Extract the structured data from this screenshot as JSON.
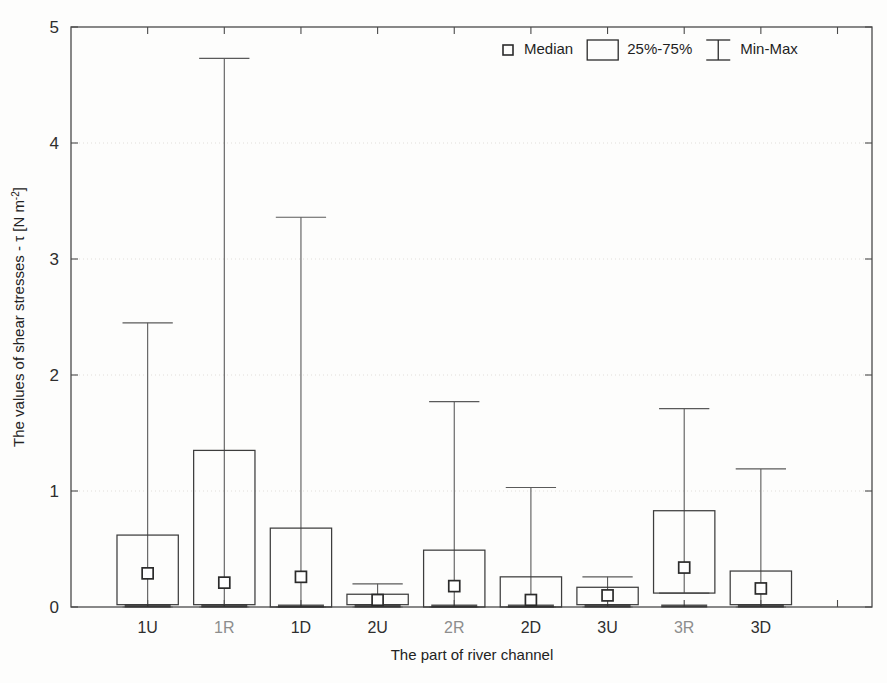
{
  "chart_data": {
    "type": "box",
    "title": "",
    "xlabel": "The part of river channel",
    "ylabel": "The values of shear stresses - τ [N m⁻²]",
    "ylabel_parts": {
      "prefix": "The values of shear stresses - τ [N m",
      "exponent": "-2",
      "suffix": "]"
    },
    "categories": [
      "1U",
      "1R",
      "1D",
      "2U",
      "2R",
      "2D",
      "3U",
      "3R",
      "3D"
    ],
    "ylim": [
      0,
      5
    ],
    "yticks": [
      0,
      1,
      2,
      3,
      4,
      5
    ],
    "ytick_labels": [
      "0",
      "1",
      "2",
      "3",
      "4",
      "5"
    ],
    "grid": true,
    "grid_axis": "y",
    "legend_position": "top-right",
    "legend": [
      {
        "key": "median",
        "label": "Median",
        "glyph": "small-square-marker"
      },
      {
        "key": "iqr",
        "label": "25%-75%",
        "glyph": "open-rectangle"
      },
      {
        "key": "minmax",
        "label": "Min-Max",
        "glyph": "capped-whisker"
      }
    ],
    "boxes": [
      {
        "category": "1U",
        "min": 0.0,
        "q1": 0.02,
        "median": 0.29,
        "q3": 0.62,
        "max": 2.45
      },
      {
        "category": "1R",
        "min": 0.0,
        "q1": 0.02,
        "median": 0.21,
        "q3": 1.35,
        "max": 4.73
      },
      {
        "category": "1D",
        "min": 0.0,
        "q1": 0.0,
        "median": 0.26,
        "q3": 0.68,
        "max": 3.36
      },
      {
        "category": "2U",
        "min": 0.0,
        "q1": 0.02,
        "median": 0.06,
        "q3": 0.11,
        "max": 0.2
      },
      {
        "category": "2R",
        "min": 0.0,
        "q1": 0.0,
        "median": 0.18,
        "q3": 0.49,
        "max": 1.77
      },
      {
        "category": "2D",
        "min": 0.0,
        "q1": 0.0,
        "median": 0.06,
        "q3": 0.26,
        "max": 1.03
      },
      {
        "category": "3U",
        "min": 0.0,
        "q1": 0.02,
        "median": 0.1,
        "q3": 0.17,
        "max": 0.26
      },
      {
        "category": "3R",
        "min": 0.12,
        "q1": 0.12,
        "median": 0.34,
        "q3": 0.83,
        "max": 1.71
      },
      {
        "category": "3D",
        "min": 0.0,
        "q1": 0.02,
        "median": 0.16,
        "q3": 0.31,
        "max": 1.19
      }
    ],
    "series_note": "Box = 25%-75% interquartile range; open square marker = median; whiskers = Min-Max"
  },
  "colors": {
    "background": "#fdfdfc",
    "axis": "#4a4a4a",
    "box_stroke": "#3d3d3d",
    "whisker": "#5a5a5a",
    "grid": "#d9d6d2",
    "text": "#232323",
    "faint_text": "#8d8d8d"
  }
}
